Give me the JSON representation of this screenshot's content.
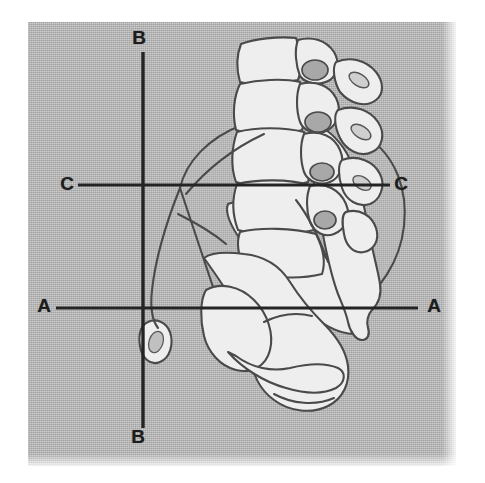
{
  "figure": {
    "kind": "anatomical-line-drawing",
    "background_color": "#b4b4b4",
    "line_color": "#3a3a3a",
    "bone_fill_color": "#ededed",
    "panel": {
      "x": 28,
      "y": 22,
      "width": 428,
      "height": 444
    }
  },
  "axes": {
    "vertical": {
      "name": "B-B",
      "orientation": "vertical",
      "x": 143,
      "y_start": 52,
      "y_end": 428,
      "top_label": "B",
      "bottom_label": "B"
    },
    "horizontal_upper": {
      "name": "C-C",
      "orientation": "horizontal",
      "y": 185,
      "x_start": 78,
      "x_end": 390,
      "left_label": "C",
      "right_label": "C"
    },
    "horizontal_lower": {
      "name": "A-A",
      "orientation": "horizontal",
      "y": 308,
      "x_start": 56,
      "x_end": 418,
      "left_label": "A",
      "right_label": "A"
    }
  },
  "labels": {
    "b_top": "B",
    "b_bottom": "B",
    "c_left": "C",
    "c_right": "C",
    "a_left": "A",
    "a_right": "A"
  },
  "structures": [
    {
      "name": "lumbar-vertebral-bodies",
      "count": 5
    },
    {
      "name": "spinous-processes",
      "count": 4
    },
    {
      "name": "sacrum"
    },
    {
      "name": "iliac-wing"
    },
    {
      "name": "acetabulum"
    },
    {
      "name": "pubic-ramus"
    },
    {
      "name": "ischial-tuberosity"
    },
    {
      "name": "coccyx"
    }
  ]
}
